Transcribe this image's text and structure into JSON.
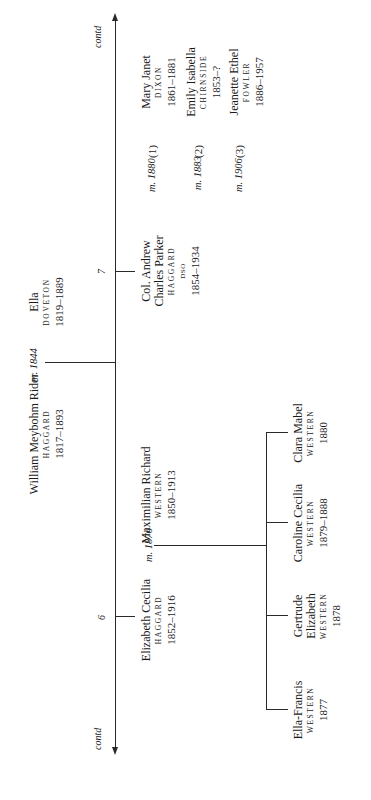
{
  "continuation": {
    "left": "contd",
    "right": "contd"
  },
  "generation_numbers": {
    "elizabeth": "6",
    "andrew": "7"
  },
  "root": {
    "husband": {
      "given": "William Meybohm Rider",
      "surname": "HAGGARD",
      "dates": "1817–1893"
    },
    "marriage": "m. 1844",
    "wife": {
      "given": "Ella",
      "surname": "DOVETON",
      "dates": "1819–1889"
    }
  },
  "elizabeth_branch": {
    "person": {
      "given": "Elizabeth Cecilia",
      "surname": "HAGGARD",
      "dates": "1852–1916"
    },
    "marriage": "m. 1876",
    "spouse": {
      "given": "Maximilian Richard",
      "surname": "WESTERN",
      "dates": "1850–1913"
    },
    "children": [
      {
        "given_line1": "Ella-Francis",
        "given_line2": "",
        "surname": "WESTERN",
        "dates": "1877"
      },
      {
        "given_line1": "Gertrude",
        "given_line2": "Elizabeth",
        "surname": "WESTERN",
        "dates": "1878"
      },
      {
        "given_line1": "Caroline Cecilia",
        "given_line2": "",
        "surname": "WESTERN",
        "dates": "1879–1888"
      },
      {
        "given_line1": "Clara Mabel",
        "given_line2": "",
        "surname": "WESTERN",
        "dates": "1880"
      }
    ]
  },
  "andrew_branch": {
    "person": {
      "given_line1": "Col. Andrew",
      "given_line2": "Charles Parker",
      "surname": "HAGGARD",
      "honour": "DSO",
      "dates": "1854–1934"
    },
    "marriages": [
      {
        "label": "m. 1880",
        "number": "(1)",
        "spouse": {
          "given": "Mary Janet",
          "surname": "DIXON",
          "dates": "1861–1881"
        }
      },
      {
        "label": "m. 1883",
        "number": "(2)",
        "spouse": {
          "given": "Emily Isabella",
          "surname": "CHIRNSIDE",
          "dates": "1853–?"
        }
      },
      {
        "label": "m. 1906",
        "number": "(3)",
        "spouse": {
          "given": "Jeanette Ethel",
          "surname": "FOWLER",
          "dates": "1886–1957"
        }
      }
    ]
  }
}
